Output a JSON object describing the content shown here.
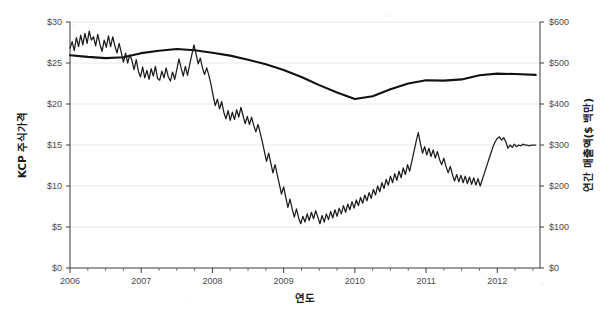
{
  "chart_data": {
    "type": "line",
    "title": "",
    "xlabel": "연도",
    "ylabel": "KCP 주식가격",
    "y2label": "연간 매출액($ 백만)",
    "xlim": [
      2006.0,
      2012.6
    ],
    "ylim": [
      0,
      30
    ],
    "y2lim": [
      0,
      600
    ],
    "grid": true,
    "legend": "none",
    "x_ticks": [
      "2006",
      "2007",
      "2008",
      "2009",
      "2010",
      "2011",
      "2012"
    ],
    "x_tick_values": [
      2006,
      2007,
      2008,
      2009,
      2010,
      2011,
      2012
    ],
    "y_ticks": [
      "$0",
      "$5",
      "$10",
      "$15",
      "$20",
      "$25",
      "$30"
    ],
    "y_tick_values": [
      0,
      5,
      10,
      15,
      20,
      25,
      30
    ],
    "y2_ticks": [
      "$0",
      "$100",
      "$200",
      "$300",
      "$400",
      "$500",
      "$600"
    ],
    "y2_tick_values": [
      0,
      100,
      200,
      300,
      400,
      500,
      600
    ],
    "series": [
      {
        "name": "KCP 주식가격",
        "axis": "left",
        "style": "jagged-daily",
        "x": [
          2006.0,
          2006.03,
          2006.06,
          2006.09,
          2006.12,
          2006.15,
          2006.18,
          2006.21,
          2006.24,
          2006.27,
          2006.3,
          2006.33,
          2006.36,
          2006.39,
          2006.42,
          2006.45,
          2006.48,
          2006.51,
          2006.54,
          2006.57,
          2006.6,
          2006.63,
          2006.66,
          2006.69,
          2006.72,
          2006.75,
          2006.78,
          2006.81,
          2006.84,
          2006.87,
          2006.9,
          2006.93,
          2006.96,
          2006.99,
          2007.02,
          2007.05,
          2007.08,
          2007.11,
          2007.14,
          2007.17,
          2007.2,
          2007.23,
          2007.26,
          2007.29,
          2007.32,
          2007.35,
          2007.38,
          2007.41,
          2007.44,
          2007.47,
          2007.5,
          2007.53,
          2007.56,
          2007.59,
          2007.62,
          2007.65,
          2007.68,
          2007.71,
          2007.74,
          2007.77,
          2007.8,
          2007.83,
          2007.86,
          2007.89,
          2007.92,
          2007.95,
          2007.98,
          2008.01,
          2008.04,
          2008.07,
          2008.1,
          2008.13,
          2008.16,
          2008.19,
          2008.22,
          2008.25,
          2008.28,
          2008.31,
          2008.34,
          2008.37,
          2008.4,
          2008.43,
          2008.46,
          2008.49,
          2008.52,
          2008.55,
          2008.58,
          2008.61,
          2008.64,
          2008.67,
          2008.7,
          2008.73,
          2008.76,
          2008.79,
          2008.82,
          2008.85,
          2008.88,
          2008.91,
          2008.94,
          2008.97,
          2009.0,
          2009.03,
          2009.06,
          2009.09,
          2009.12,
          2009.15,
          2009.18,
          2009.21,
          2009.24,
          2009.27,
          2009.3,
          2009.33,
          2009.36,
          2009.39,
          2009.42,
          2009.45,
          2009.48,
          2009.51,
          2009.54,
          2009.57,
          2009.6,
          2009.63,
          2009.66,
          2009.69,
          2009.72,
          2009.75,
          2009.78,
          2009.81,
          2009.84,
          2009.87,
          2009.9,
          2009.93,
          2009.96,
          2009.99,
          2010.02,
          2010.05,
          2010.08,
          2010.11,
          2010.14,
          2010.17,
          2010.2,
          2010.23,
          2010.26,
          2010.29,
          2010.32,
          2010.35,
          2010.38,
          2010.41,
          2010.44,
          2010.47,
          2010.5,
          2010.53,
          2010.56,
          2010.59,
          2010.62,
          2010.65,
          2010.68,
          2010.71,
          2010.74,
          2010.77,
          2010.8,
          2010.83,
          2010.86,
          2010.89,
          2010.92,
          2010.95,
          2010.98,
          2011.01,
          2011.04,
          2011.07,
          2011.1,
          2011.13,
          2011.16,
          2011.19,
          2011.22,
          2011.25,
          2011.28,
          2011.31,
          2011.34,
          2011.37,
          2011.4,
          2011.43,
          2011.46,
          2011.49,
          2011.52,
          2011.55,
          2011.58,
          2011.61,
          2011.64,
          2011.67,
          2011.7,
          2011.73,
          2011.76,
          2011.79,
          2011.82,
          2011.85,
          2011.88,
          2011.91,
          2011.94,
          2011.97,
          2012.0,
          2012.03,
          2012.06,
          2012.09,
          2012.12,
          2012.15,
          2012.18,
          2012.21,
          2012.24,
          2012.27,
          2012.3,
          2012.33,
          2012.36,
          2012.39,
          2012.42,
          2012.45,
          2012.48,
          2012.51,
          2012.54
        ],
        "y": [
          26.8,
          27.6,
          26.5,
          28.1,
          27.0,
          28.4,
          27.2,
          28.6,
          27.4,
          28.9,
          27.8,
          28.2,
          27.1,
          28.5,
          27.3,
          26.4,
          27.8,
          26.9,
          28.3,
          27.0,
          28.2,
          27.1,
          26.2,
          27.4,
          26.3,
          25.1,
          26.2,
          25.0,
          26.0,
          25.3,
          24.2,
          25.4,
          24.0,
          23.3,
          24.5,
          23.2,
          24.1,
          23.0,
          24.3,
          23.4,
          24.6,
          23.1,
          22.9,
          24.0,
          23.2,
          24.4,
          23.3,
          22.8,
          23.9,
          23.0,
          24.2,
          25.5,
          24.4,
          23.4,
          24.6,
          23.5,
          24.8,
          26.0,
          27.2,
          26.1,
          24.9,
          25.6,
          24.4,
          23.6,
          24.4,
          23.5,
          22.4,
          21.0,
          19.8,
          20.6,
          19.4,
          20.3,
          19.0,
          18.2,
          19.2,
          18.0,
          19.0,
          18.1,
          19.3,
          18.4,
          19.6,
          18.6,
          17.6,
          18.5,
          17.5,
          18.4,
          17.4,
          16.6,
          17.5,
          16.5,
          15.4,
          14.2,
          13.0,
          14.0,
          12.8,
          11.6,
          12.6,
          11.4,
          10.2,
          9.0,
          9.9,
          8.6,
          7.4,
          8.4,
          7.2,
          6.2,
          7.2,
          6.1,
          5.4,
          6.3,
          5.6,
          6.6,
          5.8,
          6.8,
          6.0,
          7.0,
          6.2,
          5.4,
          6.4,
          5.6,
          6.6,
          5.9,
          6.9,
          6.1,
          7.1,
          6.3,
          7.3,
          6.6,
          7.6,
          6.8,
          7.8,
          7.1,
          8.1,
          7.3,
          8.3,
          7.6,
          8.6,
          7.9,
          8.9,
          8.2,
          9.2,
          8.5,
          9.6,
          8.9,
          10.0,
          9.3,
          10.4,
          9.7,
          10.8,
          10.1,
          11.2,
          10.4,
          11.5,
          10.7,
          11.8,
          11.0,
          12.2,
          11.4,
          12.6,
          11.8,
          13.0,
          14.2,
          15.4,
          16.5,
          15.2,
          14.0,
          14.8,
          13.8,
          14.6,
          13.6,
          14.4,
          13.4,
          14.2,
          13.2,
          12.6,
          13.4,
          12.4,
          11.6,
          12.4,
          11.4,
          10.6,
          11.4,
          10.5,
          11.3,
          10.4,
          11.2,
          10.3,
          11.1,
          10.2,
          11.0,
          10.1,
          10.9,
          10.0,
          10.8,
          11.6,
          12.4,
          13.2,
          14.0,
          14.8,
          15.4,
          15.8,
          16.0,
          15.6,
          15.9,
          15.4,
          14.6,
          15.0,
          14.7,
          15.1,
          14.8,
          15.0,
          14.9,
          15.1,
          15.0,
          15.0,
          14.9,
          15.0,
          15.0,
          15.0
        ]
      },
      {
        "name": "연간 매출액",
        "axis": "right",
        "style": "smooth-annual",
        "x": [
          2006.0,
          2006.25,
          2006.5,
          2006.75,
          2007.0,
          2007.25,
          2007.5,
          2007.75,
          2008.0,
          2008.25,
          2008.5,
          2008.75,
          2009.0,
          2009.25,
          2009.5,
          2009.75,
          2010.0,
          2010.25,
          2010.5,
          2010.75,
          2011.0,
          2011.25,
          2011.5,
          2011.75,
          2012.0,
          2012.25,
          2012.54
        ],
        "y": [
          519,
          515,
          512,
          514,
          524,
          530,
          534,
          531,
          525,
          518,
          508,
          497,
          483,
          466,
          446,
          428,
          412,
          419,
          436,
          450,
          458,
          457,
          460,
          470,
          474,
          473,
          471
        ]
      }
    ],
    "annotations": []
  },
  "colors": {
    "stock_line": "#1b1b1b",
    "revenue_line": "#111111",
    "axis": "#3a3a3a",
    "grid": "#e9e9e9",
    "tick_label": "#4a4a4a",
    "background": "#ffffff"
  }
}
